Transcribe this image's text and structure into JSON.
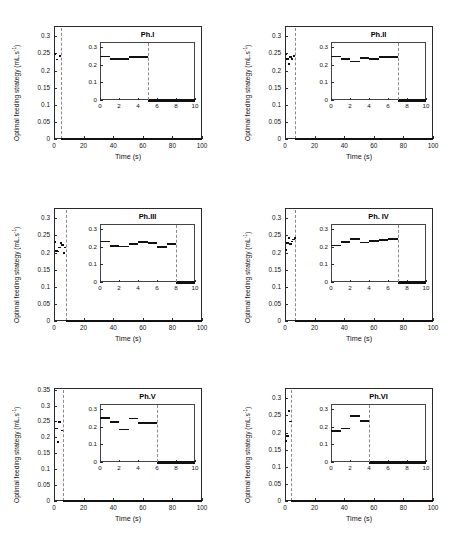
{
  "figure": {
    "panel_count": 6,
    "shared": {
      "xlabel": "Time (s)",
      "x_ticks": [
        "0",
        "20",
        "40",
        "60",
        "80",
        "100"
      ],
      "x_range": [
        0,
        100
      ],
      "inset_xlabel": "",
      "inset_x_ticks": [
        "0",
        "2",
        "4",
        "6",
        "8",
        "10"
      ],
      "inset_x_range": [
        0,
        10
      ],
      "inset_y_ticks": [
        "0",
        "0.1",
        "0.2",
        "0.3"
      ],
      "inset_y_range": [
        0,
        0.33
      ],
      "line_color": "#111111",
      "dash_color": "#8a8a8a",
      "axis_color": "#2a2a2a"
    },
    "panels": [
      {
        "id": "ph-1",
        "title": "Ph.I",
        "ylabel": "Optimal feeding strategy (mL.s",
        "ylabel_exp": "-1",
        "ylabel_tail": ")",
        "y_ticks": [
          "0",
          "0.05",
          "0.1",
          "0.15",
          "0.2",
          "0.25",
          "0.3"
        ],
        "y_range": [
          0,
          0.33
        ],
        "switch_time": 5,
        "chart_data": {
          "type": "line",
          "title": "Ph.I",
          "xlabel": "Time (s)",
          "ylabel": "Optimal feeding strategy (mL.s^-1)",
          "xlim": [
            0,
            100
          ],
          "ylim": [
            0,
            0.33
          ],
          "inset_xlim": [
            0,
            10
          ],
          "steps": [
            {
              "t_start": 0,
              "t_end": 1,
              "value": 0.248
            },
            {
              "t_start": 1,
              "t_end": 3,
              "value": 0.232
            },
            {
              "t_start": 3,
              "t_end": 5,
              "value": 0.243
            },
            {
              "t_start": 5,
              "t_end": 10,
              "value": 0.0
            }
          ],
          "tail_value": 0.0,
          "tail_range": [
            5,
            100
          ]
        }
      },
      {
        "id": "ph-2",
        "title": "Ph.II",
        "ylabel": "Optimal feeding strategy (mL.s",
        "ylabel_exp": "-1",
        "ylabel_tail": ")",
        "y_ticks": [
          "0",
          "0.05",
          "0.1",
          "0.15",
          "0.2",
          "0.25",
          "0.3"
        ],
        "y_range": [
          0,
          0.33
        ],
        "switch_time": 7,
        "chart_data": {
          "type": "line",
          "title": "Ph.II",
          "xlabel": "Time (s)",
          "ylabel": "Optimal feeding strategy (mL.s^-1)",
          "xlim": [
            0,
            100
          ],
          "ylim": [
            0,
            0.33
          ],
          "inset_xlim": [
            0,
            10
          ],
          "steps": [
            {
              "t_start": 0,
              "t_end": 1,
              "value": 0.247
            },
            {
              "t_start": 1,
              "t_end": 2,
              "value": 0.233
            },
            {
              "t_start": 2,
              "t_end": 3,
              "value": 0.22
            },
            {
              "t_start": 3,
              "t_end": 4,
              "value": 0.24
            },
            {
              "t_start": 4,
              "t_end": 5,
              "value": 0.233
            },
            {
              "t_start": 5,
              "t_end": 7,
              "value": 0.243
            },
            {
              "t_start": 7,
              "t_end": 10,
              "value": 0.0
            }
          ],
          "tail_value": 0.0,
          "tail_range": [
            7,
            100
          ]
        }
      },
      {
        "id": "ph-3",
        "title": "Ph.III",
        "ylabel": "Optimal feeding strategy (mL.s",
        "ylabel_exp": "-1",
        "ylabel_tail": ")",
        "y_ticks": [
          "0",
          "0.05",
          "0.1",
          "0.15",
          "0.2",
          "0.25",
          "0.3"
        ],
        "y_range": [
          0,
          0.33
        ],
        "switch_time": 8,
        "chart_data": {
          "type": "line",
          "title": "Ph.III",
          "xlabel": "Time (s)",
          "ylabel": "Optimal feeding strategy (mL.s^-1)",
          "xlim": [
            0,
            100
          ],
          "ylim": [
            0,
            0.33
          ],
          "inset_xlim": [
            0,
            10
          ],
          "steps": [
            {
              "t_start": 0,
              "t_end": 1,
              "value": 0.23
            },
            {
              "t_start": 1,
              "t_end": 2,
              "value": 0.205
            },
            {
              "t_start": 2,
              "t_end": 3,
              "value": 0.203
            },
            {
              "t_start": 3,
              "t_end": 4,
              "value": 0.215
            },
            {
              "t_start": 4,
              "t_end": 5,
              "value": 0.228
            },
            {
              "t_start": 5,
              "t_end": 6,
              "value": 0.222
            },
            {
              "t_start": 6,
              "t_end": 7,
              "value": 0.198
            },
            {
              "t_start": 7,
              "t_end": 8,
              "value": 0.215
            },
            {
              "t_start": 8,
              "t_end": 10,
              "value": 0.0
            }
          ],
          "tail_value": 0.0,
          "tail_range": [
            8,
            100
          ]
        }
      },
      {
        "id": "ph-4",
        "title": "Ph. IV",
        "ylabel": "Optimal feeding strategy (mL",
        "ylabel_exp": "-1",
        "ylabel_tail": ")",
        "y_ticks": [
          "0",
          "0.05",
          "0.1",
          "0.15",
          "0.2",
          "0.25",
          "0.3"
        ],
        "y_range": [
          0,
          0.33
        ],
        "switch_time": 7,
        "chart_data": {
          "type": "line",
          "title": "Ph. IV",
          "xlabel": "Time (s)",
          "ylabel": "Optimal feeding strategy (mL^-1)",
          "xlim": [
            0,
            100
          ],
          "ylim": [
            0,
            0.33
          ],
          "inset_xlim": [
            0,
            10
          ],
          "steps": [
            {
              "t_start": 0,
              "t_end": 1,
              "value": 0.208
            },
            {
              "t_start": 1,
              "t_end": 2,
              "value": 0.228
            },
            {
              "t_start": 2,
              "t_end": 3,
              "value": 0.243
            },
            {
              "t_start": 3,
              "t_end": 4,
              "value": 0.225
            },
            {
              "t_start": 4,
              "t_end": 5,
              "value": 0.232
            },
            {
              "t_start": 5,
              "t_end": 6,
              "value": 0.238
            },
            {
              "t_start": 6,
              "t_end": 7,
              "value": 0.243
            },
            {
              "t_start": 7,
              "t_end": 10,
              "value": 0.0
            }
          ],
          "tail_value": 0.0,
          "tail_range": [
            7,
            100
          ]
        }
      },
      {
        "id": "ph-5",
        "title": "Ph.V",
        "ylabel": "Optimal feeding strategy (mL.s",
        "ylabel_exp": "-1",
        "ylabel_tail": ")",
        "y_ticks": [
          "0",
          "0.05",
          "0.1",
          "0.15",
          "0.2",
          "0.25",
          "0.3",
          "0.35"
        ],
        "y_range": [
          0,
          0.355
        ],
        "switch_time": 6,
        "chart_data": {
          "type": "line",
          "title": "Ph.V",
          "xlabel": "Time (s)",
          "ylabel": "Optimal feeding strategy (mL.s^-1)",
          "xlim": [
            0,
            100
          ],
          "ylim": [
            0,
            0.355
          ],
          "inset_xlim": [
            0,
            10
          ],
          "steps": [
            {
              "t_start": 0,
              "t_end": 1,
              "value": 0.25
            },
            {
              "t_start": 1,
              "t_end": 2,
              "value": 0.228
            },
            {
              "t_start": 2,
              "t_end": 3,
              "value": 0.185
            },
            {
              "t_start": 3,
              "t_end": 4,
              "value": 0.248
            },
            {
              "t_start": 4,
              "t_end": 6,
              "value": 0.222
            },
            {
              "t_start": 6,
              "t_end": 10,
              "value": 0.0
            }
          ],
          "tail_value": 0.0,
          "tail_range": [
            6,
            100
          ]
        }
      },
      {
        "id": "ph-6",
        "title": "Ph.VI",
        "ylabel": "Optimal feeding strategy (mL.s",
        "ylabel_exp": "-1",
        "ylabel_tail": ")",
        "y_ticks": [
          "0",
          "0.05",
          "0.1",
          "0.15",
          "0.2",
          "0.25",
          "0.3"
        ],
        "y_range": [
          0,
          0.33
        ],
        "switch_time": 4,
        "chart_data": {
          "type": "line",
          "title": "Ph.VI",
          "xlabel": "Time (s)",
          "ylabel": "Optimal feeding strategy (mL.s^-1)",
          "xlim": [
            0,
            100
          ],
          "ylim": [
            0,
            0.33
          ],
          "inset_xlim": [
            0,
            10
          ],
          "steps": [
            {
              "t_start": 0,
              "t_end": 1,
              "value": 0.175
            },
            {
              "t_start": 1,
              "t_end": 2,
              "value": 0.19
            },
            {
              "t_start": 2,
              "t_end": 3,
              "value": 0.262
            },
            {
              "t_start": 3,
              "t_end": 4,
              "value": 0.232
            },
            {
              "t_start": 4,
              "t_end": 10,
              "value": 0.0
            }
          ],
          "tail_value": 0.0,
          "tail_range": [
            4,
            100
          ]
        }
      }
    ]
  }
}
